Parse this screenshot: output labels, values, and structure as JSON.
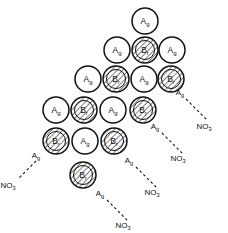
{
  "figure": {
    "width": 228,
    "height": 233,
    "background_color": "#ffffff",
    "line_color": "#141414",
    "species": {
      "silver_label": "Ag",
      "bromide_label": "Br",
      "nitrate_label": "NO",
      "nitrate_subscript": "3"
    },
    "legend_note": "White circles are Ag ions; hatched circles are Br ions"
  },
  "chart_data": {
    "type": "diagram",
    "rows": [
      {
        "index": 0,
        "y": 21,
        "ions": [
          {
            "label": "Ag",
            "kind": "silver",
            "x": 145,
            "y": 21,
            "r": 13
          }
        ]
      },
      {
        "index": 1,
        "y": 50,
        "ions": [
          {
            "label": "Ag",
            "kind": "silver",
            "x": 117,
            "y": 50,
            "r": 13
          },
          {
            "label": "Br",
            "kind": "bromide",
            "x": 145,
            "y": 50,
            "r": 13
          },
          {
            "label": "Ag",
            "kind": "silver",
            "x": 172,
            "y": 50,
            "r": 13
          }
        ]
      },
      {
        "index": 2,
        "y": 79,
        "ions": [
          {
            "label": "Ag",
            "kind": "silver",
            "x": 88,
            "y": 79,
            "r": 13
          },
          {
            "label": "Br",
            "kind": "bromide",
            "x": 116,
            "y": 79,
            "r": 13
          },
          {
            "label": "Ag",
            "kind": "silver",
            "x": 144,
            "y": 79,
            "r": 13
          },
          {
            "label": "Br",
            "kind": "bromide",
            "x": 171,
            "y": 79,
            "r": 13
          }
        ]
      },
      {
        "index": 3,
        "y": 110,
        "ions": [
          {
            "label": "Ag",
            "kind": "silver",
            "x": 56,
            "y": 110,
            "r": 13
          },
          {
            "label": "Br",
            "kind": "bromide",
            "x": 84,
            "y": 110,
            "r": 13
          },
          {
            "label": "Ag",
            "kind": "silver",
            "x": 113,
            "y": 110,
            "r": 13
          },
          {
            "label": "Br",
            "kind": "bromide",
            "x": 143,
            "y": 110,
            "r": 13
          }
        ]
      },
      {
        "index": 4,
        "y": 141,
        "ions": [
          {
            "label": "Br",
            "kind": "bromide",
            "x": 56,
            "y": 141,
            "r": 13
          },
          {
            "label": "Ag",
            "kind": "silver",
            "x": 85,
            "y": 141,
            "r": 13
          },
          {
            "label": "Br",
            "kind": "bromide",
            "x": 114,
            "y": 141,
            "r": 13
          }
        ]
      },
      {
        "index": 5,
        "y": 175,
        "ions": [
          {
            "label": "Br",
            "kind": "bromide",
            "x": 83,
            "y": 175,
            "r": 13
          }
        ]
      }
    ],
    "arrows": [
      {
        "id": "arrow-right-upper",
        "start": {
          "x": 186,
          "y": 99
        },
        "end": {
          "x": 208,
          "y": 121
        },
        "start_label": "Ag",
        "start_label_pos": {
          "x": 180,
          "y": 95
        },
        "end_label": "NO",
        "end_label_subscript": "3",
        "end_label_pos": {
          "x": 204,
          "y": 129
        }
      },
      {
        "id": "arrow-right-middle",
        "start": {
          "x": 162,
          "y": 133
        },
        "end": {
          "x": 182,
          "y": 153
        },
        "start_label": "Ag",
        "start_label_pos": {
          "x": 155,
          "y": 129
        },
        "end_label": "NO",
        "end_label_subscript": "3",
        "end_label_pos": {
          "x": 178,
          "y": 161
        }
      },
      {
        "id": "arrow-right-lower",
        "start": {
          "x": 136,
          "y": 167
        },
        "end": {
          "x": 156,
          "y": 187
        },
        "start_label": "Ag",
        "start_label_pos": {
          "x": 129,
          "y": 163
        },
        "end_label": "NO",
        "end_label_subscript": "3",
        "end_label_pos": {
          "x": 152,
          "y": 195
        }
      },
      {
        "id": "arrow-bottom-center",
        "start": {
          "x": 107,
          "y": 200
        },
        "end": {
          "x": 127,
          "y": 220
        },
        "start_label": "Ag",
        "start_label_pos": {
          "x": 100,
          "y": 196
        },
        "end_label": "NO",
        "end_label_subscript": "3",
        "end_label_pos": {
          "x": 123,
          "y": 228
        }
      },
      {
        "id": "arrow-left-lower",
        "start": {
          "x": 36,
          "y": 161
        },
        "end": {
          "x": 19,
          "y": 178
        },
        "start_label": "Ag",
        "start_label_pos": {
          "x": 36,
          "y": 158
        },
        "end_label": "NO",
        "end_label_subscript": "3",
        "end_label_pos": {
          "x": 8,
          "y": 188
        }
      }
    ]
  }
}
